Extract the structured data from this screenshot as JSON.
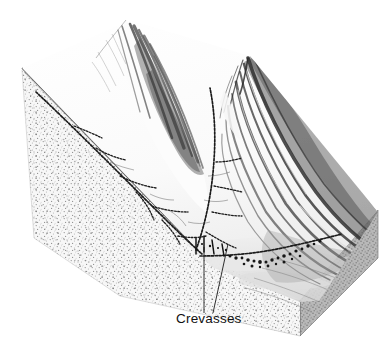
{
  "figure": {
    "kind": "block-diagram",
    "background_color": "#ffffff",
    "width": 392,
    "height": 358
  },
  "annotations": [
    {
      "id": "crevasses",
      "label": "Crevasses",
      "label_x": 176,
      "label_y": 322,
      "leaders": [
        {
          "x1": 204,
          "y1": 313,
          "x2": 204,
          "y2": 247
        },
        {
          "x1": 212,
          "y1": 313,
          "x2": 226,
          "y2": 244
        }
      ]
    }
  ],
  "features": {
    "left_peak": {
      "name": "left-mountain-peak",
      "summit_x": 126,
      "summit_y": 19,
      "ink_color": "#3a3a3a"
    },
    "right_peak": {
      "name": "right-mountain-ridge",
      "summit_x": 248,
      "summit_y": 58,
      "ink_color": "#2e2e2e"
    },
    "glacier": {
      "name": "glacier-surface",
      "surface_color": "#fbfbfb",
      "shadow_color": "#e3e3e3"
    },
    "block": {
      "name": "ground-block",
      "left_face_color": "#f4f4f4",
      "left_face_stipple": "#8d8d8d",
      "right_face_color": "#bdbdbd",
      "right_face_stipple": "#6a6a6a",
      "top_apex_x": 22,
      "top_apex_y": 68,
      "right_corner_x": 378,
      "right_corner_y": 212
    }
  },
  "colors": {
    "ink_dark": "#1a1a1a",
    "ink_mid": "#555555",
    "ink_light": "#9a9a9a",
    "paper": "#ffffff",
    "rock_gray": "#b5b5b5"
  }
}
